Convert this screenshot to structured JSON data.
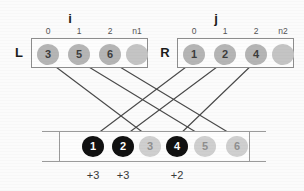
{
  "diagram": {
    "type": "merge-step-diagram",
    "labels": {
      "left_array": "L",
      "right_array": "R",
      "left_index_var": "i",
      "right_index_var": "j"
    },
    "left_array": {
      "name": "L",
      "index_var": "i",
      "column_headers": [
        "0",
        "1",
        "2",
        "n1"
      ],
      "cells": [
        {
          "value": "3",
          "style": "normal"
        },
        {
          "value": "5",
          "style": "normal"
        },
        {
          "value": "6",
          "style": "normal"
        },
        {
          "value": "",
          "style": "empty"
        }
      ]
    },
    "right_array": {
      "name": "R",
      "index_var": "j",
      "column_headers": [
        "0",
        "1",
        "2",
        "n2"
      ],
      "cells": [
        {
          "value": "1",
          "style": "normal"
        },
        {
          "value": "2",
          "style": "normal"
        },
        {
          "value": "4",
          "style": "normal"
        },
        {
          "value": "",
          "style": "empty"
        }
      ]
    },
    "merged_array": {
      "cells": [
        {
          "value": "1",
          "style": "dark"
        },
        {
          "value": "2",
          "style": "dark"
        },
        {
          "value": "3",
          "style": "pale"
        },
        {
          "value": "4",
          "style": "dark"
        },
        {
          "value": "5",
          "style": "pale"
        },
        {
          "value": "6",
          "style": "pale"
        }
      ]
    },
    "offsets": [
      "+3",
      "+3",
      "+2"
    ],
    "colors": {
      "circle_fill": "#b5b5b5",
      "circle_fill_dark": "#111111",
      "circle_fill_pale": "#cfcfcf",
      "box_border": "#8d8d8d",
      "connector": "#4a4a4a",
      "text": "#1c1c1c"
    },
    "connectors": [
      {
        "from": "L[0]=3",
        "to": "merged[2]=3"
      },
      {
        "from": "L[1]=5",
        "to": "merged[4]=5"
      },
      {
        "from": "L[2]=6",
        "to": "merged[5]=6"
      },
      {
        "from": "R[0]=1",
        "to": "merged[0]=1"
      },
      {
        "from": "R[1]=2",
        "to": "merged[1]=2"
      },
      {
        "from": "R[2]=4",
        "to": "merged[3]=4"
      }
    ]
  }
}
